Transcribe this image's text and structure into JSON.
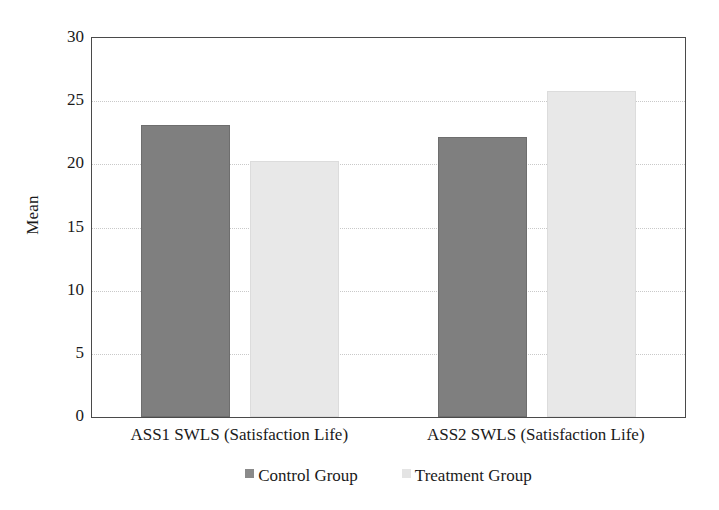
{
  "chart_data": {
    "type": "bar",
    "title": "",
    "xlabel": "",
    "ylabel": "Mean",
    "ylim": [
      0,
      30
    ],
    "yticks": [
      0,
      5,
      10,
      15,
      20,
      25,
      30
    ],
    "ytick_labels": [
      "0",
      "5",
      "10",
      "15",
      "20",
      "25",
      "30"
    ],
    "grid": true,
    "grid_axis": "y",
    "legend_position": "bottom-center",
    "categories": [
      "ASS1 SWLS (Satisfaction Life)",
      "ASS2 SWLS (Satisfaction Life)"
    ],
    "series": [
      {
        "name": "Control Group",
        "color": "#7f7f7f",
        "values": [
          23.1,
          22.2
        ]
      },
      {
        "name": "Treatment Group",
        "color": "#e8e8e8",
        "values": [
          20.3,
          25.8
        ]
      }
    ]
  },
  "legend": {
    "items": [
      {
        "label": "Control Group",
        "swatch": "control"
      },
      {
        "label": "Treatment Group",
        "swatch": "treatment"
      }
    ]
  },
  "colors": {
    "control_bar": "#7f7f7f",
    "treatment_bar": "#e8e8e8",
    "axis_line": "#4a4a4a",
    "gridline": "#c9c9c9",
    "text": "#1a1a1a",
    "background": "#ffffff"
  }
}
